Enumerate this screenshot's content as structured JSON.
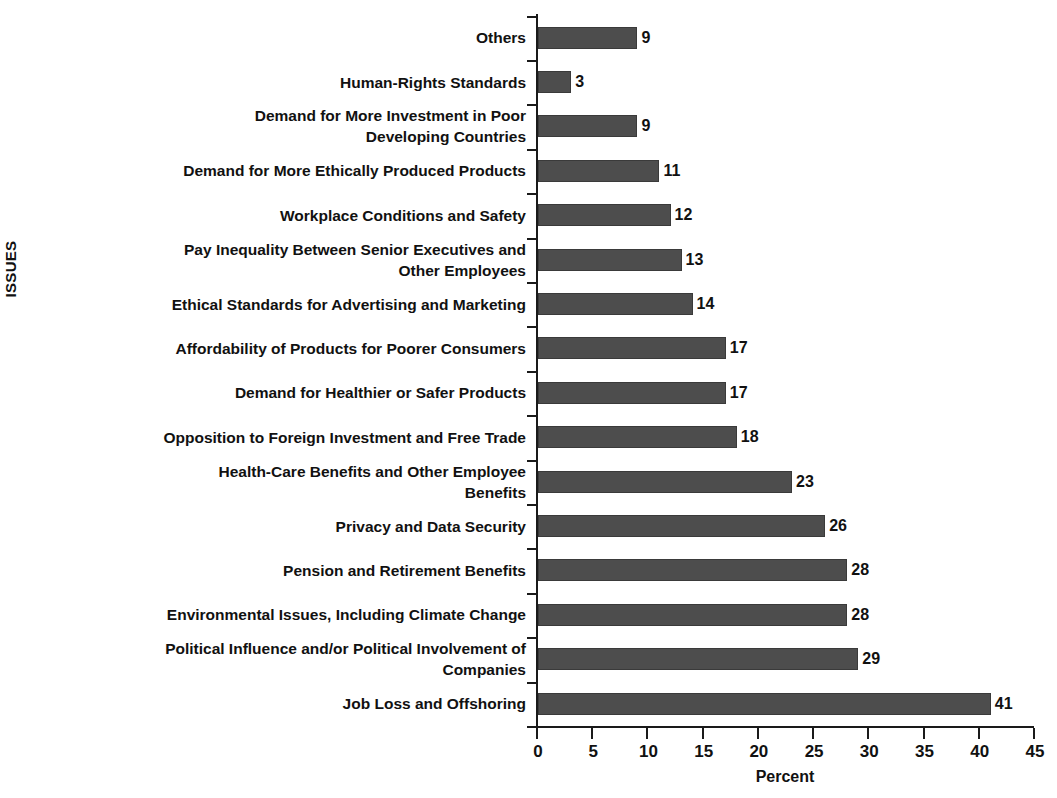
{
  "chart_data": {
    "type": "bar",
    "orientation": "horizontal",
    "title": "",
    "xlabel": "Percent",
    "ylabel": "ISSUES",
    "xlim": [
      0,
      45
    ],
    "xticks": [
      0,
      5,
      10,
      15,
      20,
      25,
      30,
      35,
      40,
      45
    ],
    "grid": false,
    "legend": null,
    "bar_color": "#4d4d4d",
    "value_labels_shown": true,
    "categories": [
      "Others",
      "Human-Rights Standards",
      "Demand for More Investment in Poor Developing Countries",
      "Demand for More Ethically Produced Products",
      "Workplace Conditions and Safety",
      "Pay Inequality Between Senior Executives and Other Employees",
      "Ethical Standards for Advertising and Marketing",
      "Affordability of Products for Poorer Consumers",
      "Demand for Healthier or Safer Products",
      "Opposition to Foreign Investment and Free Trade",
      "Health-Care Benefits and Other Employee Benefits",
      "Privacy and Data Security",
      "Pension and Retirement Benefits",
      "Environmental Issues, Including Climate Change",
      "Political Influence and/or Political Involvement of Companies",
      "Job Loss and Offshoring"
    ],
    "category_lines": [
      [
        "Others"
      ],
      [
        "Human-Rights Standards"
      ],
      [
        "Demand for More Investment in Poor",
        "Developing Countries"
      ],
      [
        "Demand for More Ethically Produced Products"
      ],
      [
        "Workplace Conditions and Safety"
      ],
      [
        "Pay Inequality Between Senior Executives and",
        "Other Employees"
      ],
      [
        "Ethical Standards for Advertising and Marketing"
      ],
      [
        "Affordability of Products for Poorer Consumers"
      ],
      [
        "Demand for Healthier or Safer Products"
      ],
      [
        "Opposition to Foreign Investment and Free Trade"
      ],
      [
        "Health-Care Benefits and Other Employee",
        "Benefits"
      ],
      [
        "Privacy and Data Security"
      ],
      [
        "Pension and Retirement Benefits"
      ],
      [
        "Environmental Issues, Including Climate Change"
      ],
      [
        "Political Influence and/or Political Involvement of",
        "Companies"
      ],
      [
        "Job Loss and Offshoring"
      ]
    ],
    "values": [
      9,
      3,
      9,
      11,
      12,
      13,
      14,
      17,
      17,
      18,
      23,
      26,
      28,
      28,
      29,
      41
    ],
    "value_label_text": [
      "9",
      "3",
      "9",
      "11",
      "12",
      "13",
      "14",
      "17",
      "17",
      "18",
      "23",
      "26",
      "28",
      "28",
      "29",
      "41"
    ],
    "xtick_labels": [
      "0",
      "5",
      "10",
      "15",
      "20",
      "25",
      "30",
      "35",
      "40",
      "45"
    ]
  }
}
